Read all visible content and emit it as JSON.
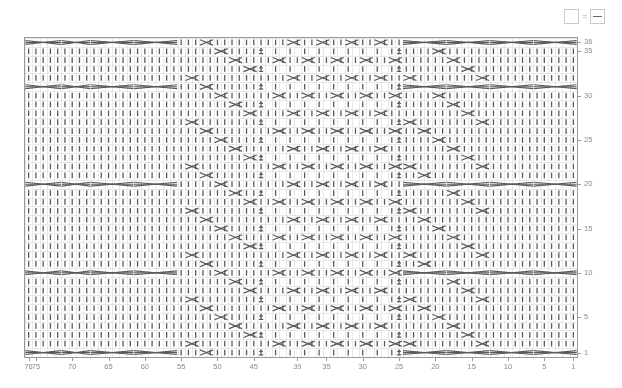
{
  "legend": {
    "plain_symbol_name": "empty-square",
    "equals": "=",
    "purl_symbol_name": "square-with-dash"
  },
  "chart": {
    "title": "",
    "rows": 36,
    "columns": 76,
    "border_color": "#9a9a9a",
    "grid_color": "#e8e8e8",
    "symbol_color": "#5a5a5a",
    "background": "#ffffff"
  },
  "axes": {
    "x": {
      "position": "bottom",
      "direction": "right-to-left",
      "ticks": [
        76,
        75,
        70,
        65,
        60,
        55,
        50,
        45,
        39,
        35,
        30,
        25,
        20,
        15,
        10,
        5,
        1
      ],
      "labels": [
        "76",
        "75",
        "70",
        "65",
        "60",
        "55",
        "50",
        "45",
        "39",
        "35",
        "30",
        "25",
        "20",
        "15",
        "10",
        "5",
        "1"
      ]
    },
    "y": {
      "position": "right",
      "direction": "bottom-to-top",
      "ticks": [
        36,
        35,
        30,
        25,
        20,
        15,
        10,
        5,
        1
      ],
      "labels": [
        "36",
        "35",
        "30",
        "25",
        "20",
        "15",
        "10",
        "5",
        "1"
      ]
    }
  },
  "chart_data": {
    "type": "heatmap",
    "title": "",
    "xlabel": "",
    "ylabel": "",
    "xlim": [
      76,
      1
    ],
    "ylim": [
      1,
      36
    ],
    "grid": true,
    "legend_position": "top-right",
    "symbols": {
      "knit": "vertical-bar",
      "purl": "horizontal-dash",
      "cable_cross": "x-cross",
      "cable_wide": "wide-cross",
      "twist": "bobble-mark"
    },
    "cable_rows": [
      1,
      10,
      20,
      31,
      36
    ],
    "marker_columns": [
      44,
      25
    ],
    "panel_boundaries": [
      1,
      13,
      25,
      44,
      56,
      68,
      76
    ]
  }
}
